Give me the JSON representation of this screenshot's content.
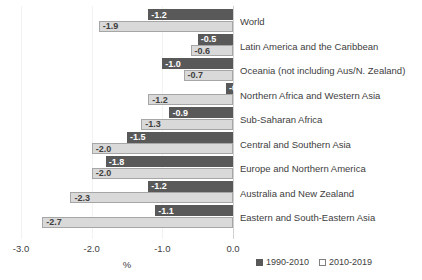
{
  "chart_data": {
    "type": "bar",
    "orientation": "horizontal",
    "title": "",
    "subtitle": "",
    "xlabel": "%",
    "ylabel": "",
    "xlim": [
      -3.0,
      0.0
    ],
    "xticks": [
      "-3.0",
      "-2.0",
      "-1.0",
      "0.0"
    ],
    "xtick_values": [
      -3.0,
      -2.0,
      -1.0,
      0.0
    ],
    "grid": true,
    "legend_position": "bottom-right",
    "categories": [
      "World",
      "Latin America and the Caribbean",
      "Oceania (not including Aus/N. Zealand)",
      "Northern Africa and Western Asia",
      "Sub-Saharan Africa",
      "Central and Southern Asia",
      "Europe and Northern America",
      "Australia and New Zealand",
      "Eastern and South-Eastern Asia"
    ],
    "series": [
      {
        "name": "1990-2010",
        "color": "#595959",
        "values": [
          -1.2,
          -0.5,
          -1.0,
          -0.1,
          -0.9,
          -1.5,
          -1.8,
          -1.2,
          -1.1
        ],
        "labels": [
          "-1.2",
          "-0.5",
          "-1.0",
          "-0.1",
          "-0.9",
          "-1.5",
          "-1.8",
          "-1.2",
          "-1.1"
        ]
      },
      {
        "name": "2010-2019",
        "color": "#d9d9d9",
        "values": [
          -1.9,
          -0.6,
          -0.7,
          -1.2,
          -1.3,
          -2.0,
          -2.0,
          -2.3,
          -2.7
        ],
        "labels": [
          "-1.9",
          "-0.6",
          "-0.7",
          "-1.2",
          "-1.3",
          "-2.0",
          "-2.0",
          "-2.3",
          "-2.7"
        ]
      }
    ]
  },
  "legend": {
    "items": [
      {
        "label": "1990-2010",
        "swatch": "dark-square-icon"
      },
      {
        "label": "2010-2019",
        "swatch": "light-square-icon"
      }
    ]
  }
}
